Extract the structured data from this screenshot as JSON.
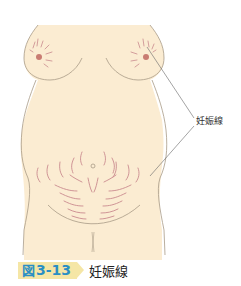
{
  "figure": {
    "number_prefix": "図",
    "number": "3-13",
    "title": "妊娠線",
    "annotation_label": "妊娠線"
  },
  "colors": {
    "skin": "#fbecd2",
    "outline": "#a89a86",
    "striae": "#c98a8e",
    "nipple": "#c97c72",
    "tag_bg": "#f5e6a6",
    "tag_text": "#2a8fc4",
    "leader_line": "#666666"
  }
}
